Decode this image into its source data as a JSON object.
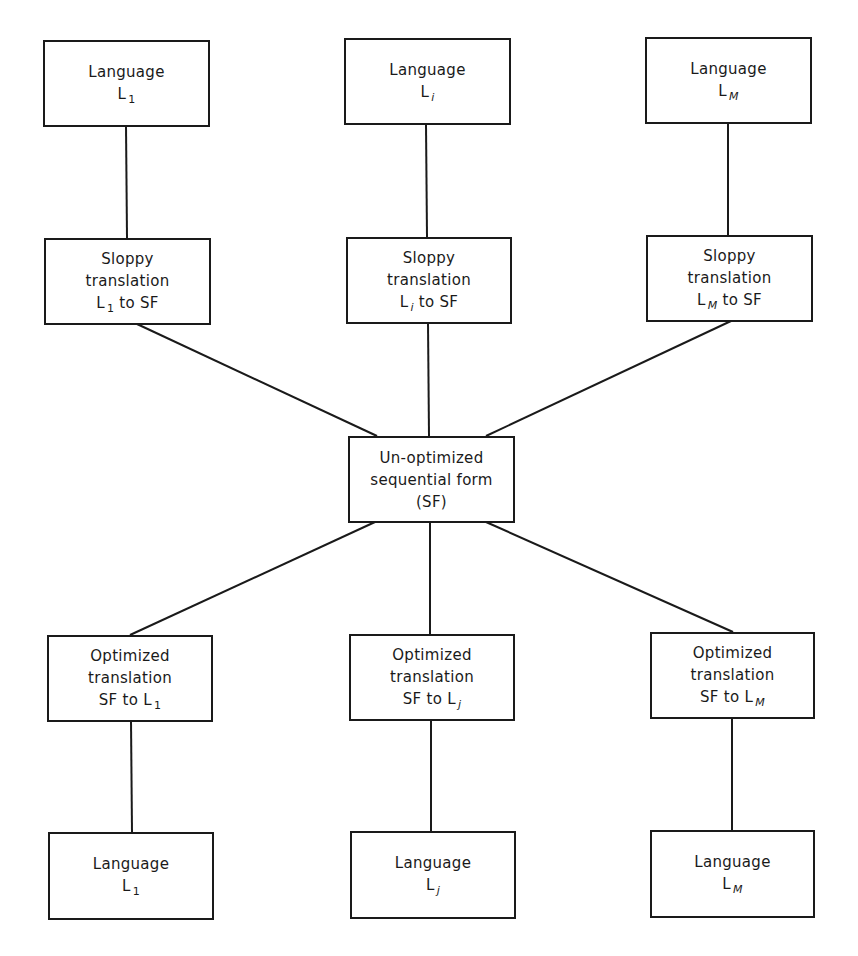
{
  "diagram": {
    "type": "translation-architecture",
    "colors": {
      "stroke": "#1a1a1a",
      "background": "#ffffff"
    },
    "sources": [
      {
        "label": "Language",
        "symbol": "L",
        "sub": "1",
        "sub_italic": false
      },
      {
        "label": "Language",
        "symbol": "L",
        "sub": "i",
        "sub_italic": true
      },
      {
        "label": "Language",
        "symbol": "L",
        "sub": "M",
        "sub_italic": true
      }
    ],
    "sloppy": [
      {
        "line1": "Sloppy",
        "line2": "translation",
        "symbol": "L",
        "sub": "1",
        "tail": "to SF"
      },
      {
        "line1": "Sloppy",
        "line2": "translation",
        "symbol": "L",
        "sub": "i",
        "tail": "to SF"
      },
      {
        "line1": "Sloppy",
        "line2": "translation",
        "symbol": "L",
        "sub": "M",
        "tail": "to SF"
      }
    ],
    "center": {
      "line1": "Un-optimized",
      "line2": "sequential form",
      "line3": "(SF)"
    },
    "optimized": [
      {
        "line1": "Optimized",
        "line2": "translation",
        "head": "SF to",
        "symbol": "L",
        "sub": "1"
      },
      {
        "line1": "Optimized",
        "line2": "translation",
        "head": "SF to",
        "symbol": "L",
        "sub": "j"
      },
      {
        "line1": "Optimized",
        "line2": "translation",
        "head": "SF to",
        "symbol": "L",
        "sub": "M"
      }
    ],
    "targets": [
      {
        "label": "Language",
        "symbol": "L",
        "sub": "1"
      },
      {
        "label": "Language",
        "symbol": "L",
        "sub": "j"
      },
      {
        "label": "Language",
        "symbol": "L",
        "sub": "M"
      }
    ]
  }
}
